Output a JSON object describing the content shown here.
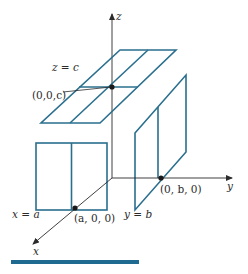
{
  "figure": {
    "axes": {
      "x_label": "x",
      "y_label": "y",
      "z_label": "z"
    },
    "planes": [
      {
        "id": "z-plane",
        "equation": "z = c"
      },
      {
        "id": "x-plane",
        "equation": "x = a"
      },
      {
        "id": "y-plane",
        "equation": "y = b"
      }
    ],
    "points": [
      {
        "id": "point-c",
        "label": "(0,0,c)"
      },
      {
        "id": "point-a",
        "label": "(a, 0, 0)"
      },
      {
        "id": "point-b",
        "label": "(0, b, 0)"
      }
    ],
    "colors": {
      "plane_stroke": "#2a6f8e",
      "axis_stroke": "#2b2b2b",
      "bottom_rule": "#1f6a91"
    }
  }
}
